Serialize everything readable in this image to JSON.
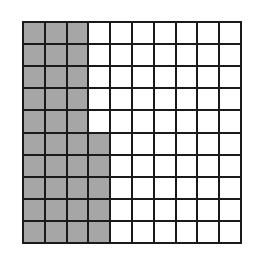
{
  "diagram": {
    "type": "hundred-grid",
    "rows": 10,
    "columns": 10,
    "shaded_count": 35,
    "total_cells": 100,
    "shaded_pattern": "columns 1-3 fully shaded (rows 1-10); column 4 shaded in rows 6-10",
    "shaded_cells": [
      [
        1,
        1
      ],
      [
        1,
        2
      ],
      [
        1,
        3
      ],
      [
        2,
        1
      ],
      [
        2,
        2
      ],
      [
        2,
        3
      ],
      [
        3,
        1
      ],
      [
        3,
        2
      ],
      [
        3,
        3
      ],
      [
        4,
        1
      ],
      [
        4,
        2
      ],
      [
        4,
        3
      ],
      [
        5,
        1
      ],
      [
        5,
        2
      ],
      [
        5,
        3
      ],
      [
        6,
        1
      ],
      [
        6,
        2
      ],
      [
        6,
        3
      ],
      [
        6,
        4
      ],
      [
        7,
        1
      ],
      [
        7,
        2
      ],
      [
        7,
        3
      ],
      [
        7,
        4
      ],
      [
        8,
        1
      ],
      [
        8,
        2
      ],
      [
        8,
        3
      ],
      [
        8,
        4
      ],
      [
        9,
        1
      ],
      [
        9,
        2
      ],
      [
        9,
        3
      ],
      [
        9,
        4
      ],
      [
        10,
        1
      ],
      [
        10,
        2
      ],
      [
        10,
        3
      ],
      [
        10,
        4
      ]
    ],
    "colors": {
      "shaded": "#a6a6a6",
      "unshaded": "#ffffff",
      "lines": "#1a1a1a"
    }
  }
}
